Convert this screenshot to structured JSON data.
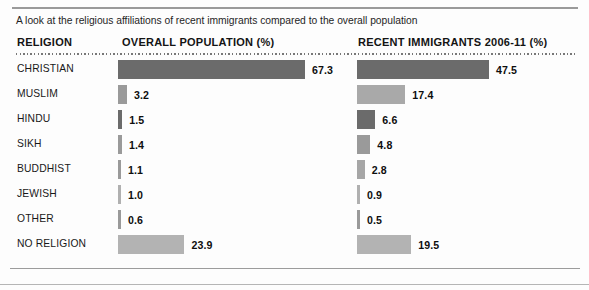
{
  "deck": {
    "text": "A look at the religious affiliations of recent immigrants compared to the overall population"
  },
  "headers": {
    "religion": "RELIGION",
    "overall": "OVERALL POPULATION (%)",
    "recent": "RECENT IMMIGRANTS 2006-11 (%)"
  },
  "colors": {
    "bar_dark": "#6b6b6b",
    "bar_mid": "#9a9a9a",
    "bar_light": "#b8b8b8",
    "text": "#141414",
    "rule": "#9a9a9a",
    "background": "#fdfdfd"
  },
  "chart_data": {
    "type": "bar",
    "title": "A look at the religious affiliations of recent immigrants compared to the overall population",
    "xlabel": "",
    "ylabel": "",
    "orientation": "horizontal",
    "unit": "%",
    "scale_px_per_unit": 2.78,
    "categories": [
      "CHRISTIAN",
      "MUSLIM",
      "HINDU",
      "SIKH",
      "BUDDHIST",
      "JEWISH",
      "OTHER",
      "NO RELIGION"
    ],
    "series": [
      {
        "name": "OVERALL POPULATION (%)",
        "values": [
          67.3,
          3.2,
          1.5,
          1.4,
          1.1,
          1.0,
          0.6,
          23.9
        ],
        "labels": [
          "67.3",
          "3.2",
          "1.5",
          "1.4",
          "1.1",
          "1.0",
          "0.6",
          "23.9"
        ],
        "bar_colors": [
          "#6b6b6b",
          "#9a9a9a",
          "#6b6b6b",
          "#9a9a9a",
          "#9a9a9a",
          "#b0b0b0",
          "#9a9a9a",
          "#b3b3b3"
        ]
      },
      {
        "name": "RECENT IMMIGRANTS 2006-11 (%)",
        "values": [
          47.5,
          17.4,
          6.6,
          4.8,
          2.8,
          0.9,
          0.5,
          19.5
        ],
        "labels": [
          "47.5",
          "17.4",
          "6.6",
          "4.8",
          "2.8",
          "0.9",
          "0.5",
          "19.5"
        ],
        "bar_colors": [
          "#6b6b6b",
          "#a9a9a9",
          "#6b6b6b",
          "#9a9a9a",
          "#a6a6a6",
          "#b0b0b0",
          "#9a9a9a",
          "#b3b3b3"
        ]
      }
    ],
    "grid": false,
    "legend": "none"
  }
}
